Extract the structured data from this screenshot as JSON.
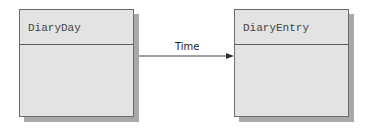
{
  "diagram": {
    "type": "uml-class",
    "classes": [
      {
        "name": "DiaryDay"
      },
      {
        "name": "DiaryEntry"
      }
    ],
    "association": {
      "label": "Time",
      "from": "DiaryDay",
      "to": "DiaryEntry",
      "direction": "navigable-to-target"
    }
  }
}
